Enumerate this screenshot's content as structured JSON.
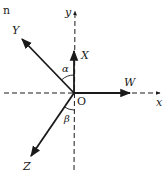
{
  "figure": {
    "partial_text": "n",
    "origin_label": "O",
    "axes": {
      "x_label": "x",
      "y_label": "y",
      "style": "dashed"
    },
    "vectors": [
      {
        "id": "X",
        "label": "X",
        "direction": "up along +y"
      },
      {
        "id": "W",
        "label": "W",
        "direction": "right along +x"
      },
      {
        "id": "Y",
        "label": "Y",
        "direction": "up-left"
      },
      {
        "id": "Z",
        "label": "Z",
        "direction": "down-left"
      }
    ],
    "angles": [
      {
        "label": "α",
        "between": [
          "Y",
          "X"
        ]
      },
      {
        "label": "β",
        "between": [
          "Z",
          "-y axis"
        ]
      }
    ],
    "colors": {
      "stroke": "#1a1a1a",
      "background": "#ffffff"
    }
  }
}
